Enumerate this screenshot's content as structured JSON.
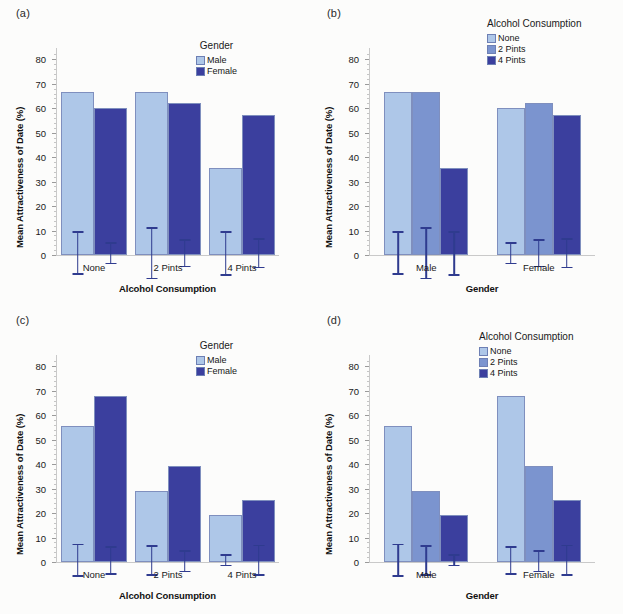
{
  "figure": {
    "background": "#fcfcfb",
    "colors": {
      "light_blue": "#aec7e8",
      "medium_blue": "#7b94cf",
      "dark_blue": "#3b3f9e",
      "error_bar": "#2f3b8f",
      "axis": "#c9c9c9"
    },
    "ylabel": "Mean Attractiveness of Date (%)",
    "yticks": [
      0,
      10,
      20,
      30,
      40,
      50,
      60,
      70,
      80
    ],
    "ylim": [
      0,
      85
    ]
  },
  "panels": [
    {
      "label": "(a)",
      "chart_data": {
        "type": "bar",
        "title": "",
        "xlabel": "Alcohol Consumption",
        "ylabel": "Mean Attractiveness of Date (%)",
        "ylim": [
          0,
          85
        ],
        "yticks": [
          0,
          10,
          20,
          30,
          40,
          50,
          60,
          70,
          80
        ],
        "grid": false,
        "legend_title": "Gender",
        "legend_position": "top-right",
        "categories": [
          "None",
          "2 Pints",
          "4 Pints"
        ],
        "series": [
          {
            "name": "Male",
            "color": "#aec7e8",
            "values": [
              66.9,
              66.9,
              35.6
            ],
            "err_low": [
              58.2,
              56.3,
              26.4
            ],
            "err_high": [
              75.6,
              77.4,
              44.6
            ]
          },
          {
            "name": "Female",
            "color": "#3b3f9e",
            "values": [
              60.5,
              62.5,
              57.4
            ],
            "err_low": [
              56.2,
              56.9,
              51.5
            ],
            "err_high": [
              64.8,
              68.0,
              63.2
            ]
          }
        ]
      }
    },
    {
      "label": "(b)",
      "chart_data": {
        "type": "bar",
        "title": "",
        "xlabel": "Gender",
        "ylabel": "Mean Attractiveness of Date (%)",
        "ylim": [
          0,
          85
        ],
        "yticks": [
          0,
          10,
          20,
          30,
          40,
          50,
          60,
          70,
          80
        ],
        "grid": false,
        "legend_title": "Alcohol Consumption",
        "legend_position": "top-right",
        "categories": [
          "Male",
          "Female"
        ],
        "series": [
          {
            "name": "None",
            "color": "#aec7e8",
            "values": [
              66.9,
              60.5
            ],
            "err_low": [
              58.2,
              56.2
            ],
            "err_high": [
              75.6,
              64.8
            ]
          },
          {
            "name": "2 Pints",
            "color": "#7b94cf",
            "values": [
              66.9,
              62.5
            ],
            "err_low": [
              56.3,
              56.9
            ],
            "err_high": [
              77.4,
              68.0
            ]
          },
          {
            "name": "4 Pints",
            "color": "#3b3f9e",
            "values": [
              35.6,
              57.4
            ],
            "err_low": [
              26.4,
              51.5
            ],
            "err_high": [
              44.6,
              63.2
            ]
          }
        ]
      }
    },
    {
      "label": "(c)",
      "chart_data": {
        "type": "bar",
        "title": "",
        "xlabel": "Alcohol Consumption",
        "ylabel": "Mean Attractiveness of Date (%)",
        "ylim": [
          0,
          85
        ],
        "yticks": [
          0,
          10,
          20,
          30,
          40,
          50,
          60,
          70,
          80
        ],
        "grid": false,
        "legend_title": "Gender",
        "legend_position": "top-right",
        "categories": [
          "None",
          "2 Pints",
          "4 Pints"
        ],
        "series": [
          {
            "name": "Male",
            "color": "#aec7e8",
            "values": [
              55.8,
              29.0,
              19.3
            ],
            "err_low": [
              49.3,
              22.8,
              17.0
            ],
            "err_high": [
              62.3,
              35.1,
              21.5
            ]
          },
          {
            "name": "Female",
            "color": "#3b3f9e",
            "values": [
              68.1,
              39.4,
              25.6
            ],
            "err_low": [
              62.3,
              34.7,
              19.2
            ],
            "err_high": [
              73.7,
              43.2,
              31.8
            ]
          }
        ]
      }
    },
    {
      "label": "(d)",
      "chart_data": {
        "type": "bar",
        "title": "",
        "xlabel": "Gender",
        "ylabel": "Mean Attractiveness of Date (%)",
        "ylim": [
          0,
          85
        ],
        "yticks": [
          0,
          10,
          20,
          30,
          40,
          50,
          60,
          70,
          80
        ],
        "grid": false,
        "legend_title": "Alcohol Consumption",
        "legend_position": "top-right",
        "categories": [
          "Male",
          "Female"
        ],
        "series": [
          {
            "name": "None",
            "color": "#aec7e8",
            "values": [
              55.8,
              68.1
            ],
            "err_low": [
              49.3,
              62.3
            ],
            "err_high": [
              62.3,
              73.7
            ]
          },
          {
            "name": "2 Pints",
            "color": "#7b94cf",
            "values": [
              29.0,
              39.4
            ],
            "err_low": [
              22.8,
              34.7
            ],
            "err_high": [
              35.1,
              43.2
            ]
          },
          {
            "name": "4 Pints",
            "color": "#3b3f9e",
            "values": [
              19.3,
              25.6
            ],
            "err_low": [
              17.0,
              19.2
            ],
            "err_high": [
              21.5,
              31.8
            ]
          }
        ]
      }
    }
  ]
}
